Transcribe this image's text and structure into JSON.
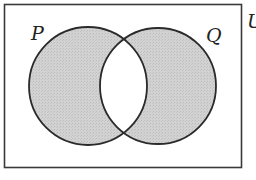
{
  "diagram": {
    "type": "venn",
    "universal_set": {
      "label": "U"
    },
    "sets": [
      {
        "name": "P",
        "label": "P"
      },
      {
        "name": "Q",
        "label": "Q"
      }
    ],
    "shaded_region": "P Δ Q (symmetric difference: in P or Q but not both)",
    "colors": {
      "shade": "#cfcfcf",
      "outline": "#2a2a2a",
      "background": "#ffffff"
    }
  }
}
